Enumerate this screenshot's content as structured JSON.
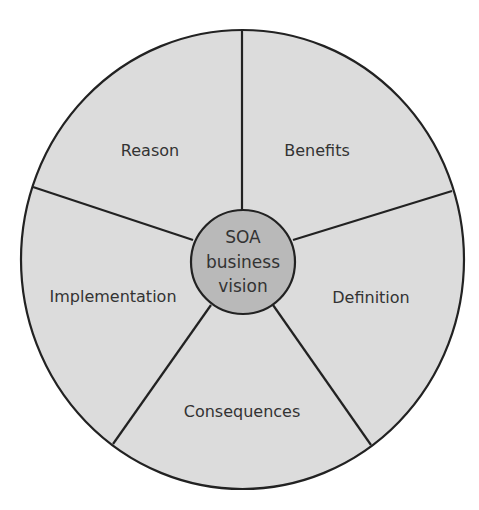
{
  "diagram": {
    "type": "radial-segments",
    "center": {
      "lines": [
        "SOA",
        "business",
        "vision"
      ]
    },
    "segments": [
      {
        "label": "Reason"
      },
      {
        "label": "Benefits"
      },
      {
        "label": "Definition"
      },
      {
        "label": "Consequences"
      },
      {
        "label": "Implementation"
      }
    ],
    "colors": {
      "outer_fill": "#dcdcdc",
      "inner_fill": "#b9b9b9",
      "stroke": "#222222",
      "text": "#333333"
    }
  }
}
